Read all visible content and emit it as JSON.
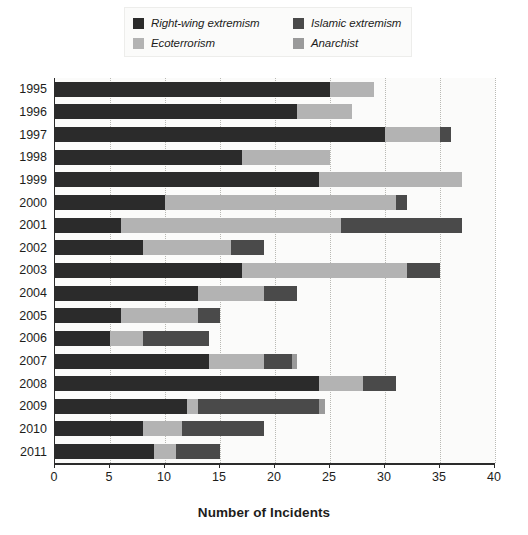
{
  "chart_data": {
    "type": "bar",
    "orientation": "horizontal",
    "stacked": true,
    "title": "",
    "xlabel": "Number of Incidents",
    "ylabel": "",
    "xlim": [
      0,
      40
    ],
    "xticks": [
      0,
      5,
      10,
      15,
      20,
      25,
      30,
      35,
      40
    ],
    "grid": "vertical-dotted",
    "legend_position": "top-center",
    "categories": [
      "1995",
      "1996",
      "1997",
      "1998",
      "1999",
      "2000",
      "2001",
      "2002",
      "2003",
      "2004",
      "2005",
      "2006",
      "2007",
      "2008",
      "2009",
      "2010",
      "2011"
    ],
    "series": [
      {
        "name": "Right-wing extremism",
        "color": "#2b2b2b",
        "values": [
          25,
          22,
          30,
          17,
          24,
          10,
          6,
          8,
          17,
          13,
          6,
          5,
          14,
          24,
          12,
          8,
          9
        ]
      },
      {
        "name": "Ecoterrorism",
        "color": "#b3b3b3",
        "values": [
          4,
          5,
          5,
          8,
          13,
          21,
          20,
          8,
          15,
          6,
          7,
          3,
          5,
          4,
          1,
          3.5,
          2
        ]
      },
      {
        "name": "Islamic extremism",
        "color": "#4a4a4a",
        "values": [
          0,
          0,
          1,
          0,
          0,
          1,
          11,
          3,
          3,
          3,
          2,
          6,
          2.5,
          3,
          11,
          7.5,
          4
        ]
      },
      {
        "name": "Anarchist",
        "color": "#9a9a9a",
        "values": [
          0,
          0,
          0,
          0,
          0,
          0,
          0,
          0,
          0,
          0,
          0,
          0,
          0.5,
          0,
          0.5,
          0,
          0
        ]
      }
    ],
    "totals": [
      29,
      27,
      36,
      25,
      37,
      32,
      37,
      19,
      35,
      22,
      15,
      14,
      22,
      31,
      24.5,
      19,
      15
    ],
    "bar_stack_order": [
      "Right-wing extremism",
      "Ecoterrorism",
      "Islamic extremism",
      "Anarchist"
    ]
  },
  "legend": {
    "items": [
      {
        "label": "Right-wing extremism",
        "color": "#2b2b2b"
      },
      {
        "label": "Islamic extremism",
        "color": "#4a4a4a"
      },
      {
        "label": "Ecoterrorism",
        "color": "#b3b3b3"
      },
      {
        "label": "Anarchist",
        "color": "#9a9a9a"
      }
    ]
  },
  "axis": {
    "x_title": "Number of Incidents",
    "x_tick_labels": [
      "0",
      "5",
      "10",
      "15",
      "20",
      "25",
      "30",
      "35",
      "40"
    ],
    "y_tick_labels": [
      "1995",
      "1996",
      "1997",
      "1998",
      "1999",
      "2000",
      "2001",
      "2002",
      "2003",
      "2004",
      "2005",
      "2006",
      "2007",
      "2008",
      "2009",
      "2010",
      "2011"
    ]
  },
  "colors": {
    "background": "#ffffff",
    "plot_background": "#fbfbfa",
    "axis": "#2b2b2b",
    "gridline": "#b9b9b4",
    "text": "#1d1d1b"
  }
}
